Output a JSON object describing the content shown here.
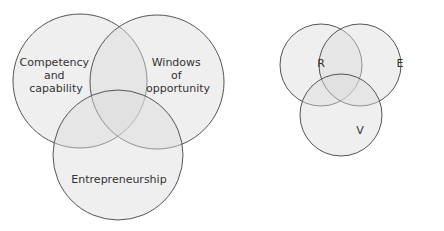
{
  "colors": {
    "fill": "#dcdcdc",
    "stroke": "#555555",
    "background": "#ffffff"
  },
  "diagrams": [
    {
      "name": "left-venn",
      "circles": [
        {
          "label_lines": [
            "Competency",
            "and",
            "capability"
          ]
        },
        {
          "label_lines": [
            "Windows",
            "of",
            "opportunity"
          ]
        },
        {
          "label_lines": [
            "Entrepreneurship"
          ]
        }
      ]
    },
    {
      "name": "right-venn",
      "circles": [
        {
          "label": "R"
        },
        {
          "label": "E"
        },
        {
          "label": "V"
        }
      ]
    }
  ]
}
